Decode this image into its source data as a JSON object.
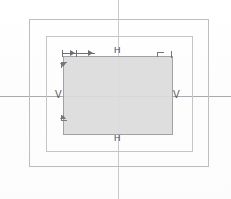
{
  "canvas": {
    "width": 231,
    "height": 199,
    "background": "#ffffff",
    "title": "box-alignment-diagram"
  },
  "palette": {
    "paper": "#ffffff",
    "frame_stroke": "#c2c2c6",
    "fill_box": "#dcdcdc",
    "fill_box_stroke": "#9b9b9f",
    "centerline": "#c9c9ce",
    "centerline_h": "#a9a9ae",
    "label_text": "#55555a",
    "arrow": "#6e6e73"
  },
  "labels": {
    "top_h": "H",
    "bottom_h": "H",
    "left_v": "V",
    "right_v": "V"
  },
  "geometry": {
    "outer_frame": {
      "x": 29,
      "y": 19,
      "width": 180,
      "height": 148
    },
    "middle_frame": {
      "x": 46,
      "y": 36,
      "width": 147,
      "height": 116
    },
    "fill_box": {
      "x": 63,
      "y": 56,
      "width": 110,
      "height": 79
    },
    "center_vertical_x": 118,
    "center_horizontal_y": 96
  },
  "markers": {
    "top_dimension_arrow": {
      "name": "horizontal-dimension-arrow",
      "x": 62,
      "y": 50,
      "width": 33,
      "direction": "right"
    },
    "right_corner_tick": {
      "x": 157,
      "y": 52
    },
    "left_edge_ticks": [
      {
        "label": "upper-left-edge-tick",
        "x": 62,
        "y": 64
      },
      {
        "label": "lower-left-edge-tick",
        "x": 62,
        "y": 118
      }
    ]
  }
}
